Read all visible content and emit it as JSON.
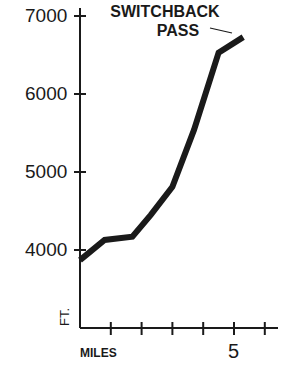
{
  "chart_data": {
    "type": "line",
    "title": "",
    "xlabel": "MILES",
    "ylabel": "FT.",
    "x_tick_labels": [
      {
        "value": 5,
        "label": "5"
      }
    ],
    "x_ticks": [
      1,
      2,
      3,
      4,
      5,
      6
    ],
    "y_tick_labels": [
      "4000",
      "5000",
      "6000",
      "7000"
    ],
    "y_ticks": [
      4000,
      5000,
      6000,
      7000
    ],
    "xlim": [
      0,
      6.3
    ],
    "ylim": [
      3000,
      7200
    ],
    "grid": false,
    "legend": null,
    "annotations": [
      {
        "text": "SWITCHBACK PASS",
        "x": 5.3,
        "y": 6730
      }
    ],
    "series": [
      {
        "name": "Elevation",
        "x": [
          0,
          0.8,
          1.7,
          2.3,
          3.0,
          3.7,
          4.5,
          5.3
        ],
        "values": [
          3870,
          4130,
          4170,
          4450,
          4810,
          5540,
          6530,
          6730
        ]
      }
    ]
  },
  "labels": {
    "y4000": "4000",
    "y5000": "5000",
    "y6000": "6000",
    "y7000": "7000",
    "annotation_line1": "SWITCHBACK",
    "annotation_line2": "PASS",
    "xlabel": "MILES",
    "x5": "5",
    "ylabel": "FT."
  }
}
